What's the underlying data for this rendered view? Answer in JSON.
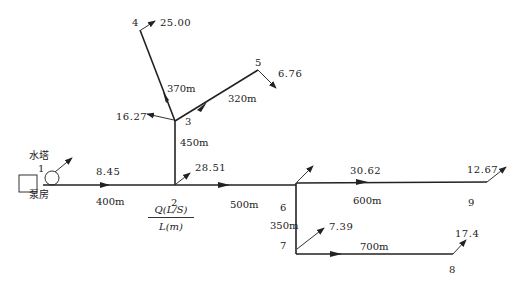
{
  "diagram": {
    "type": "water-supply-pipe-network",
    "legend": {
      "numerator": "Q(L/S)",
      "denominator": "L(m)"
    },
    "facilities": {
      "water_tower": "水塔",
      "pump_house": "泵房"
    },
    "nodes": [
      {
        "id": "1",
        "label": "1"
      },
      {
        "id": "2",
        "label": "2",
        "outflow": "28.51"
      },
      {
        "id": "3",
        "label": "3",
        "outflow": "16.27"
      },
      {
        "id": "4",
        "label": "4",
        "outflow": "25.00"
      },
      {
        "id": "5",
        "label": "5",
        "outflow": "6.76"
      },
      {
        "id": "6",
        "label": "6"
      },
      {
        "id": "7",
        "label": "7",
        "outflow": "7.39"
      },
      {
        "id": "8",
        "label": "8",
        "outflow": "17.4"
      },
      {
        "id": "9",
        "label": "9",
        "outflow": "12.67"
      }
    ],
    "pipes": [
      {
        "from": "1",
        "to": "2",
        "flow": "8.45",
        "length": "400m"
      },
      {
        "from": "2",
        "to": "3",
        "length": "450m"
      },
      {
        "from": "3",
        "to": "4",
        "length": "370m"
      },
      {
        "from": "3",
        "to": "5",
        "length": "320m"
      },
      {
        "from": "2",
        "to": "6",
        "length": "500m"
      },
      {
        "from": "6",
        "to": "9",
        "flow": "30.62",
        "length": "600m"
      },
      {
        "from": "6",
        "to": "7",
        "length": "350m"
      },
      {
        "from": "7",
        "to": "8",
        "length": "700m"
      }
    ]
  }
}
